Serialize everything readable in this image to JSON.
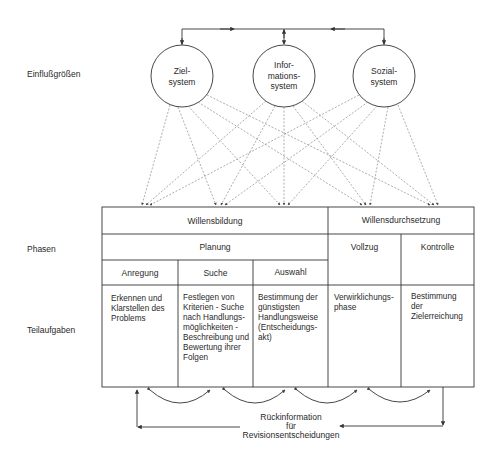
{
  "side_labels": {
    "influences": "Einflußgrößen",
    "phases": "Phasen",
    "subtasks": "Teilaufgaben"
  },
  "systems": [
    {
      "line1": "Ziel-",
      "line2": "system",
      "line3": ""
    },
    {
      "line1": "Infor-",
      "line2": "mations-",
      "line3": "system"
    },
    {
      "line1": "Sozial-",
      "line2": "system",
      "line3": ""
    }
  ],
  "table": {
    "phase_groups": [
      "Willensbildung",
      "Willensdurchsetzung"
    ],
    "phases": [
      "Planung",
      "Vollzug",
      "Kontrolle"
    ],
    "planning_steps": [
      "Anregung",
      "Suche",
      "Auswahl"
    ],
    "tasks": [
      [
        "Erkennen und",
        "Klarstellen des",
        "Problems"
      ],
      [
        "Festlegen von",
        "Kriterien - Suche",
        "nach Handlungs-",
        "möglichkeiten -",
        "Beschreibung und",
        "Bewertung ihrer",
        "Folgen"
      ],
      [
        "Bestimmung der",
        "günstigsten",
        "Handlungsweise",
        "(Entscheidungs-",
        "akt)"
      ],
      [
        "Verwirklichungs-",
        "phase"
      ],
      [
        "Bestimmung",
        "der",
        "Zielerreichung"
      ]
    ]
  },
  "feedback": {
    "line1": "Rückinformation",
    "line2": "für",
    "line3": "Revisionsentscheidungen"
  },
  "colors": {
    "line": "#3a3a3a",
    "dashed": "#8a8a8a",
    "background": "#ffffff"
  }
}
